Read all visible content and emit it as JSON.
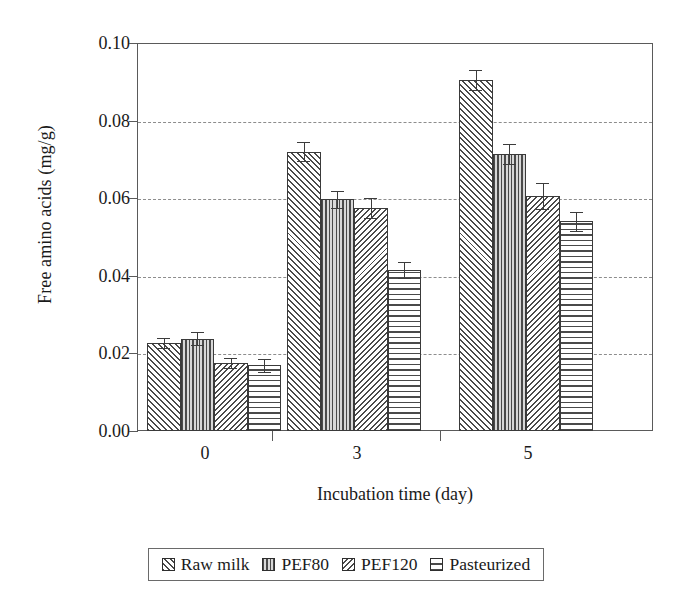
{
  "chart_data": {
    "type": "bar",
    "title": "",
    "xlabel": "Incubation time (day)",
    "ylabel": "Free amino acids (mg/g)",
    "categories": [
      "0",
      "3",
      "5"
    ],
    "ylim": [
      0.0,
      0.1
    ],
    "ytick_labels": [
      "0.00",
      "0.02",
      "0.04",
      "0.06",
      "0.08",
      "0.10"
    ],
    "ytick_values": [
      0.0,
      0.02,
      0.04,
      0.06,
      0.08,
      0.1
    ],
    "grid": "horizontal-dashed",
    "legend_position": "below-axes",
    "series": [
      {
        "name": "Raw milk",
        "pattern": "diagonal-forward-hatch",
        "values": [
          0.0227,
          0.072,
          0.0905
        ],
        "errors": [
          0.0013,
          0.0025,
          0.0026
        ]
      },
      {
        "name": "PEF80",
        "pattern": "vertical-lines",
        "values": [
          0.0238,
          0.0597,
          0.0714
        ],
        "errors": [
          0.0016,
          0.0022,
          0.0026
        ]
      },
      {
        "name": "PEF120",
        "pattern": "diagonal-back-hatch",
        "values": [
          0.0176,
          0.0574,
          0.0605
        ],
        "errors": [
          0.0013,
          0.0026,
          0.0034
        ]
      },
      {
        "name": "Pasteurized",
        "pattern": "horizontal-lines",
        "values": [
          0.0169,
          0.0415,
          0.054
        ],
        "errors": [
          0.0016,
          0.0021,
          0.0024
        ]
      }
    ]
  },
  "axes": {
    "ylabel": "Free amino acids (mg/g)",
    "xlabel": "Incubation time (day)",
    "ytick_0": "0.00",
    "ytick_1": "0.02",
    "ytick_2": "0.04",
    "ytick_3": "0.06",
    "ytick_4": "0.08",
    "ytick_5": "0.10",
    "xtick_0": "0",
    "xtick_1": "3",
    "xtick_2": "5"
  },
  "legend": {
    "items": [
      {
        "label": "Raw milk"
      },
      {
        "label": "PEF80"
      },
      {
        "label": "PEF120"
      },
      {
        "label": "Pasteurized"
      }
    ]
  },
  "colors": {
    "frame": "#5a5a5a",
    "grid": "#8d8d8d",
    "bar_outline": "#3a3a3a",
    "hatch": "#4a4a4a",
    "background": "#ffffff"
  }
}
